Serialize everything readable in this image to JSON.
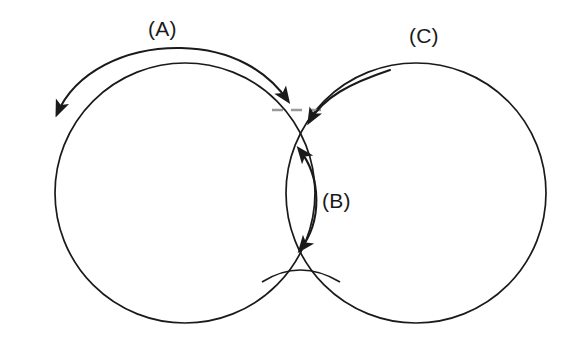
{
  "figure": {
    "name": "two-sphere-sintering-neck-diagram",
    "background_color": "#ffffff",
    "stroke_color": "#1a1a1a",
    "dashed_color": "#9a9a9a",
    "width": 584,
    "height": 343
  },
  "labels": {
    "a": "(A)",
    "b": "(B)",
    "c": "(C)"
  },
  "chart_data": {
    "type": "diagram",
    "title": "",
    "shapes": [
      {
        "id": "left-circle",
        "kind": "circle",
        "cx": 185,
        "cy": 193,
        "r": 130,
        "stroke": "#1a1a1a",
        "fill": "none"
      },
      {
        "id": "right-circle",
        "kind": "circle",
        "cx": 416,
        "cy": 193,
        "r": 130,
        "stroke": "#1a1a1a",
        "fill": "none"
      },
      {
        "id": "neck-bottom-bridge",
        "kind": "arc",
        "stroke": "#1a1a1a",
        "fill": "none"
      },
      {
        "id": "tangent-dashed-segment",
        "kind": "dashed-line",
        "x1": 276,
        "y1": 110,
        "x2": 318,
        "y2": 110,
        "stroke": "#9a9a9a"
      }
    ],
    "annotations": [
      {
        "id": "arrow-a",
        "label": "(A)",
        "kind": "double-headed-arc-arrow",
        "placement": "above top arc of left circle",
        "direction": "bidirectional, tangential along surface"
      },
      {
        "id": "arrow-b",
        "label": "(B)",
        "kind": "double-headed-arc-arrow",
        "placement": "vertical through the neck between the circles",
        "direction": "bidirectional, along neck axis"
      },
      {
        "id": "arrow-c",
        "label": "(C)",
        "kind": "single-headed-curved-arrow",
        "placement": "from upper-left arc of right circle into the neck",
        "direction": "toward the neck"
      }
    ],
    "axis": {
      "grid": false,
      "legend": false,
      "xlabel": "",
      "ylabel": ""
    }
  }
}
